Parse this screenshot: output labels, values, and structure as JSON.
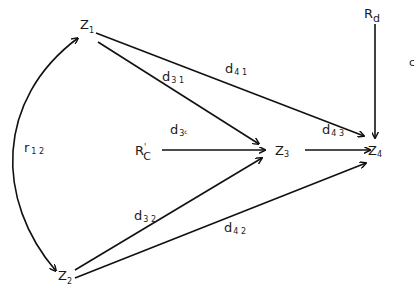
{
  "diagram": {
    "type": "path-diagram",
    "colors": {
      "stroke": "#111111",
      "text": "#1a1a1a",
      "background": "#ffffff"
    },
    "nodes": {
      "z1": {
        "base": "Z",
        "sub": "1"
      },
      "z2": {
        "base": "Z",
        "sub": "2"
      },
      "z3": {
        "base": "Z",
        "sub": "3"
      },
      "z4": {
        "base": "Z",
        "sub": "4"
      },
      "rc": {
        "base": "R",
        "prime": "'",
        "sub": "C"
      },
      "rd": {
        "base": "R",
        "sub": "d"
      },
      "cut": {
        "text": "c"
      }
    },
    "edges": {
      "r12": {
        "base": "r",
        "sub": "1 2",
        "from": "Z2",
        "to": "Z1",
        "type": "bidirectional-curve"
      },
      "d31": {
        "base": "d",
        "sub": "3 1",
        "from": "Z1",
        "to": "Z3"
      },
      "d41": {
        "base": "d",
        "sub": "4 1",
        "from": "Z1",
        "to": "Z4"
      },
      "d3c": {
        "base": "d",
        "sub": "3",
        "subsub": "c",
        "from": "R'C",
        "to": "Z3"
      },
      "d43": {
        "base": "d",
        "sub": "4 3",
        "from": "Z3",
        "to": "Z4"
      },
      "d32": {
        "base": "d",
        "sub": "3 2",
        "from": "Z2",
        "to": "Z3"
      },
      "d42": {
        "base": "d",
        "sub": "4 2",
        "from": "Z2",
        "to": "Z4"
      },
      "d4d": {
        "from": "Rd",
        "to": "Z4"
      }
    }
  }
}
